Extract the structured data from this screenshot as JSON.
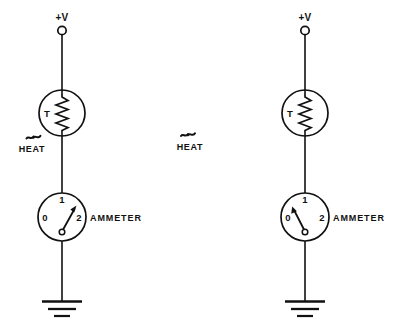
{
  "figure": {
    "background_color": "#ffffff",
    "ink_color": "#111111",
    "width": 401,
    "height": 334
  },
  "labels": {
    "supply": "+V",
    "thermistor": "T",
    "ammeter": "AMMETER",
    "heat": "HEAT"
  },
  "circuits": [
    {
      "id": "left",
      "name": "heated-circuit",
      "center_x": 62,
      "supply_label": "+V",
      "thermistor": {
        "label": "T",
        "heated": true,
        "heat_label": "HEAT"
      },
      "ammeter": {
        "name": "AMMETER",
        "scale": [
          "0",
          "1",
          "2"
        ],
        "reading": "2",
        "needle_direction": "up-right"
      },
      "ground": true
    },
    {
      "id": "right",
      "name": "unheated-circuit",
      "center_x": 305,
      "supply_label": "+V",
      "thermistor": {
        "label": "T",
        "heated": false,
        "heat_label": ""
      },
      "ammeter": {
        "name": "AMMETER",
        "scale": [
          "0",
          "1",
          "2"
        ],
        "reading": "0",
        "needle_direction": "up-left"
      },
      "ground": true
    }
  ],
  "center_annotation": {
    "heat_label": "HEAT",
    "x": 190,
    "y": 148
  }
}
